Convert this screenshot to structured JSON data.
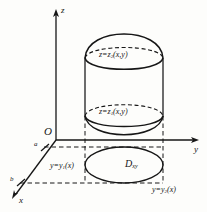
{
  "figure": {
    "type": "diagram",
    "background_color": "#fdfdfb",
    "line_color": "#161616",
    "axes": {
      "z_label": "z",
      "y_label": "y",
      "x_label": "x",
      "origin_label": "O"
    },
    "x_axis_marks": {
      "a": "a",
      "b": "b"
    },
    "surfaces": {
      "top": {
        "prefix": "z=z",
        "index": "2",
        "args": "(x,y)"
      },
      "bottom": {
        "prefix": "z=z",
        "index": "1",
        "args": "(x,y)"
      }
    },
    "projection": {
      "domain_label": "D",
      "domain_sub": "xy",
      "left_boundary": {
        "prefix": "y=y",
        "index": "1",
        "args": "(x)"
      },
      "right_boundary": {
        "prefix": "y=y",
        "index": "2",
        "args": "(x)"
      }
    }
  }
}
